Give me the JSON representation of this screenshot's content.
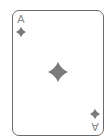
{
  "card": {
    "rank": "A",
    "suit": "diamonds",
    "suit_icon": "diamond-icon",
    "pip_color": "#7a7a7a",
    "rank_color": "#8a8a8a",
    "border_color": "#6a6a6a",
    "face_color": "#ffffff"
  }
}
